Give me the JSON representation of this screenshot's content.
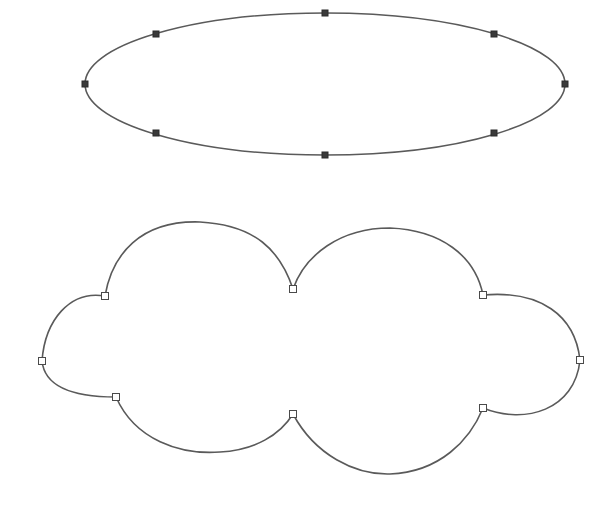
{
  "canvas": {
    "width": 609,
    "height": 507,
    "background": "#ffffff",
    "stroke_color": "#5a5a5a"
  },
  "ellipse": {
    "label": "ellipse-shape",
    "center": [
      325,
      84
    ],
    "rx": 240,
    "ry": 71,
    "handle_style": "filled",
    "handles": [
      [
        325,
        13
      ],
      [
        494,
        34
      ],
      [
        565,
        84
      ],
      [
        494,
        133
      ],
      [
        325,
        155
      ],
      [
        156,
        133
      ],
      [
        85,
        84
      ],
      [
        156,
        34
      ]
    ]
  },
  "cloud": {
    "label": "cloud-shape",
    "path": "M293,289 C280,250 255,225 200,222 C140,220 112,255 105,296 C70,290 45,320 42,361 C45,390 80,397 116,397 C135,440 180,455 220,452 C255,450 280,435 293,414 C315,455 355,475 390,474 C440,472 470,440 483,408 C525,425 575,410 580,360 C575,315 540,290 483,295 C475,255 440,230 390,228 C340,228 305,255 293,289 Z",
    "handle_style": "hollow",
    "handles": [
      [
        293,
        289
      ],
      [
        483,
        295
      ],
      [
        580,
        360
      ],
      [
        483,
        408
      ],
      [
        293,
        414
      ],
      [
        116,
        397
      ],
      [
        42,
        361
      ],
      [
        105,
        296
      ]
    ]
  }
}
